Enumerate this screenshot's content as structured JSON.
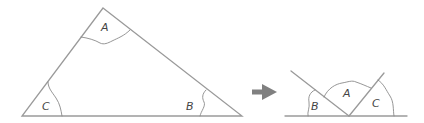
{
  "diagram": {
    "colors": {
      "line": "#9a9a9a",
      "arc": "#8a8a8a",
      "label": "#444444",
      "arrow": "#808080",
      "background": "#ffffff"
    },
    "triangle": {
      "vertices": {
        "A": [
          103,
          8
        ],
        "B": [
          242,
          116
        ],
        "C": [
          22,
          116
        ]
      },
      "labels": {
        "A": "A",
        "B": "B",
        "C": "C"
      }
    },
    "arrow": {
      "icon": "right-arrow-icon",
      "from": [
        252,
        92
      ],
      "to": [
        276,
        92
      ]
    },
    "rearranged": {
      "baseline": [
        [
          285,
          116
        ],
        [
          407,
          116
        ]
      ],
      "meeting_point": [
        349,
        116
      ],
      "labels": {
        "B": "B",
        "A": "A",
        "C": "C"
      },
      "order_left_to_right": [
        "B",
        "A",
        "C"
      ]
    }
  }
}
